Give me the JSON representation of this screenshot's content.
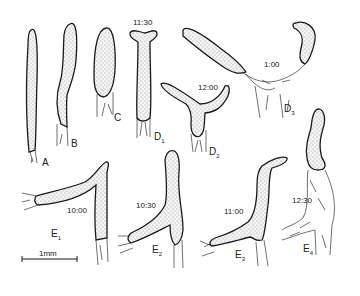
{
  "figure": {
    "type": "scientific-illustration",
    "panels": [
      {
        "id": "A",
        "label": "A",
        "subscript": "",
        "time": ""
      },
      {
        "id": "B",
        "label": "B",
        "subscript": "",
        "time": ""
      },
      {
        "id": "C",
        "label": "C",
        "subscript": "",
        "time": ""
      },
      {
        "id": "D1",
        "label": "D",
        "subscript": "1",
        "time": "11:30"
      },
      {
        "id": "D2",
        "label": "D",
        "subscript": "2",
        "time": "12:00"
      },
      {
        "id": "D3",
        "label": "D",
        "subscript": "3",
        "time": "1:00"
      },
      {
        "id": "E1",
        "label": "E",
        "subscript": "1",
        "time": "10:00"
      },
      {
        "id": "E2",
        "label": "E",
        "subscript": "2",
        "time": "10:30"
      },
      {
        "id": "E3",
        "label": "E",
        "subscript": "3",
        "time": "11:00"
      },
      {
        "id": "E4",
        "label": "E",
        "subscript": "4",
        "time": "12:30"
      }
    ],
    "scale_bar": {
      "label": "1mm"
    }
  },
  "colors": {
    "ink": "#1a1a1a",
    "background": "#ffffff"
  }
}
